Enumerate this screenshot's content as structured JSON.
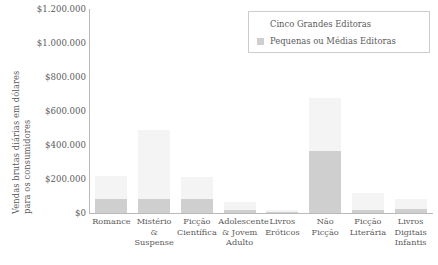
{
  "chart_data": {
    "type": "bar",
    "subtype": "stacked-bar",
    "title": "",
    "xlabel": "",
    "ylabel": "Vendas brutas diárias em dólares para os consumidores",
    "ylim": [
      0,
      1200000
    ],
    "ytick_values": [
      0,
      200000,
      400000,
      600000,
      800000,
      1000000,
      1200000
    ],
    "ytick_labels": [
      "$0",
      "$200.000",
      "$400.000",
      "$600.000",
      "$800.000",
      "$1.000.000",
      "$1.200.000"
    ],
    "currency_symbol": "$",
    "grid": false,
    "legend_position": "top-right",
    "categories": [
      "Romance",
      "Mistério & Suspense",
      "Ficção Científica",
      "Adolescente & Jovem Adulto",
      "Livros Eróticos",
      "Não Ficção",
      "Ficção Literária",
      "Livros Digitais Infantis"
    ],
    "category_lines": [
      [
        "Romance"
      ],
      [
        "Mistério &",
        "Suspense"
      ],
      [
        "Ficção",
        "Científica"
      ],
      [
        "Adolescente",
        "& Jovem",
        "Adulto"
      ],
      [
        "Livros",
        "Eróticos"
      ],
      [
        "Não",
        "Ficção"
      ],
      [
        "Ficção",
        "Literária"
      ],
      [
        "Livros",
        "Digitais",
        "Infantis"
      ]
    ],
    "series": [
      {
        "name": "Cinco Grandes Editoras",
        "color": "#f4f4f4",
        "values": [
          140000,
          410000,
          130000,
          45000,
          10000,
          310000,
          100000,
          60000
        ]
      },
      {
        "name": "Pequenas ou Médias Editoras",
        "color": "#cfcfcf",
        "values": [
          80000,
          80000,
          80000,
          20000,
          5000,
          365000,
          20000,
          25000
        ]
      }
    ],
    "totals": [
      220000,
      490000,
      210000,
      65000,
      15000,
      675000,
      120000,
      85000
    ]
  },
  "legend": {
    "items": [
      {
        "label": "Cinco Grandes Editoras",
        "swatch": "white-square-swatch"
      },
      {
        "label": "Pequenas ou Médias Editoras",
        "swatch": "gray-square-swatch"
      }
    ]
  },
  "axis": {
    "y_title_line1": "Vendas brutas diárias em dólares",
    "y_title_line2": "para os consumidores"
  },
  "colors": {
    "series_big": "#f4f4f4",
    "series_small": "#cfcfcf",
    "axis": "#b9b9b9",
    "text": "#5a5a5a",
    "background": "#ffffff",
    "legend_border": "#cccccc"
  }
}
